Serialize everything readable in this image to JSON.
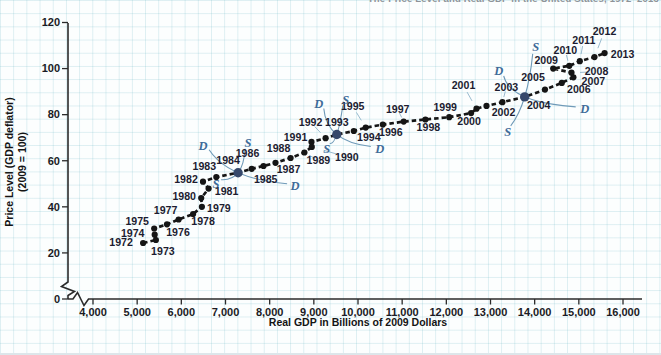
{
  "header": {
    "caption": "The Price Level and Real GDP in the United States, 1972–2013"
  },
  "colors": {
    "point": "#151515",
    "highlight_point": "#36486b",
    "dashed_line": "#161616",
    "axis": "#2b2b2b",
    "year_label": "#1c1c30",
    "sd_label": "#3f6b99",
    "sd_curve": "#6f9ab8",
    "leader_line": "#8fb3c9",
    "grid_line": "#cde4ec",
    "paper": "#fcfefe",
    "caption_text": "#8e9398"
  },
  "chart_data": {
    "type": "scatter",
    "title": "The Price Level and Real GDP in the United States, 1972–2013",
    "xlabel": "Real GDP in Billions of 2009 Dollars",
    "ylabel": "Price Level (GDP deflator) (2009 = 100)",
    "ylabel_line1": "Price Level (GDP deflator)",
    "ylabel_line2": "(2009 = 100)",
    "xlim": [
      4000,
      16000
    ],
    "ylim": [
      0,
      120
    ],
    "grid": true,
    "x_axis_break": true,
    "y_axis_break": true,
    "legend": "none",
    "x_ticks": [
      {
        "value": 4000,
        "label": "4,000"
      },
      {
        "value": 5000,
        "label": "5,000"
      },
      {
        "value": 6000,
        "label": "6,000"
      },
      {
        "value": 7000,
        "label": "7,000"
      },
      {
        "value": 8000,
        "label": "8,000"
      },
      {
        "value": 9000,
        "label": "9,000"
      },
      {
        "value": 10000,
        "label": "10,000"
      },
      {
        "value": 11000,
        "label": "11,000"
      },
      {
        "value": 12000,
        "label": "12,000"
      },
      {
        "value": 13000,
        "label": "13,000"
      },
      {
        "value": 14000,
        "label": "14,000"
      },
      {
        "value": 15000,
        "label": "15,000"
      },
      {
        "value": 16000,
        "label": "16,000"
      }
    ],
    "y_ticks": [
      {
        "value": 0,
        "label": "0"
      },
      {
        "value": 20,
        "label": "20"
      },
      {
        "value": 40,
        "label": "40"
      },
      {
        "value": 60,
        "label": "60"
      },
      {
        "value": 80,
        "label": "80"
      },
      {
        "value": 100,
        "label": "100"
      },
      {
        "value": 120,
        "label": "120"
      }
    ],
    "series": [
      {
        "points": [
          {
            "year": 1972,
            "x": 5134,
            "y": 24.3
          },
          {
            "year": 1973,
            "x": 5424,
            "y": 25.6
          },
          {
            "year": 1974,
            "x": 5396,
            "y": 27.9
          },
          {
            "year": 1975,
            "x": 5385,
            "y": 30.6
          },
          {
            "year": 1976,
            "x": 5675,
            "y": 32.4
          },
          {
            "year": 1977,
            "x": 5937,
            "y": 34.5
          },
          {
            "year": 1978,
            "x": 6267,
            "y": 36.9
          },
          {
            "year": 1979,
            "x": 6466,
            "y": 40.0
          },
          {
            "year": 1980,
            "x": 6450,
            "y": 43.8
          },
          {
            "year": 1981,
            "x": 6618,
            "y": 47.9
          },
          {
            "year": 1982,
            "x": 6491,
            "y": 50.9
          },
          {
            "year": 1983,
            "x": 6792,
            "y": 52.9
          },
          {
            "year": 1984,
            "x": 7285,
            "y": 54.8
          },
          {
            "year": 1985,
            "x": 7594,
            "y": 56.5
          },
          {
            "year": 1986,
            "x": 7861,
            "y": 57.7
          },
          {
            "year": 1987,
            "x": 8133,
            "y": 59.1
          },
          {
            "year": 1988,
            "x": 8475,
            "y": 61.2
          },
          {
            "year": 1989,
            "x": 8786,
            "y": 63.6
          },
          {
            "year": 1990,
            "x": 8955,
            "y": 66.0
          },
          {
            "year": 1991,
            "x": 8948,
            "y": 68.2
          },
          {
            "year": 1992,
            "x": 9267,
            "y": 69.8
          },
          {
            "year": 1993,
            "x": 9521,
            "y": 71.4
          },
          {
            "year": 1994,
            "x": 9905,
            "y": 72.9
          },
          {
            "year": 1995,
            "x": 10175,
            "y": 74.4
          },
          {
            "year": 1996,
            "x": 10561,
            "y": 75.7
          },
          {
            "year": 1997,
            "x": 11035,
            "y": 77.0
          },
          {
            "year": 1998,
            "x": 11526,
            "y": 77.9
          },
          {
            "year": 1999,
            "x": 12066,
            "y": 78.9
          },
          {
            "year": 2000,
            "x": 12560,
            "y": 80.7
          },
          {
            "year": 2001,
            "x": 12682,
            "y": 82.6
          },
          {
            "year": 2002,
            "x": 12909,
            "y": 83.8
          },
          {
            "year": 2003,
            "x": 13270,
            "y": 85.4
          },
          {
            "year": 2004,
            "x": 13774,
            "y": 87.7
          },
          {
            "year": 2005,
            "x": 14235,
            "y": 90.9
          },
          {
            "year": 2006,
            "x": 14615,
            "y": 93.8
          },
          {
            "year": 2007,
            "x": 14877,
            "y": 96.2
          },
          {
            "year": 2008,
            "x": 14834,
            "y": 98.2
          },
          {
            "year": 2009,
            "x": 14419,
            "y": 100.0
          },
          {
            "year": 2010,
            "x": 14784,
            "y": 101.2
          },
          {
            "year": 2011,
            "x": 15021,
            "y": 103.2
          },
          {
            "year": 2012,
            "x": 15355,
            "y": 105.0
          },
          {
            "year": 2013,
            "x": 15583,
            "y": 106.7
          }
        ]
      }
    ],
    "highlighted_years": [
      1984,
      1993,
      2004
    ],
    "annotations": {
      "demand_label": "D",
      "supply_label": "S",
      "crossing_years": [
        1984,
        1993,
        2004
      ]
    }
  }
}
